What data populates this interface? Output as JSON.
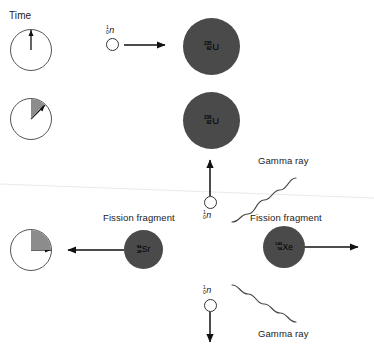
{
  "figure": {
    "background_color": "#ffffff",
    "nucleus_color": "#4a4a4a",
    "line_color": "#333333"
  },
  "time_axis": {
    "label": "Time",
    "clocks": [
      {
        "name": "clock-stage-1",
        "hand_angle_deg": 0,
        "wedge_end_deg": 0,
        "wedge_filled": false
      },
      {
        "name": "clock-stage-2",
        "hand_angle_deg": 42,
        "wedge_end_deg": 42,
        "wedge_filled": true
      },
      {
        "name": "clock-stage-3",
        "hand_angle_deg": 90,
        "wedge_end_deg": 90,
        "wedge_filled": true
      }
    ]
  },
  "particles": {
    "incident_neutron": {
      "symbol": "n",
      "mass_number": "1",
      "atomic_number": "0",
      "direction": "right"
    },
    "emitted_neutron_up": {
      "symbol": "n",
      "mass_number": "1",
      "atomic_number": "0",
      "direction": "up"
    },
    "emitted_neutron_down": {
      "symbol": "n",
      "mass_number": "1",
      "atomic_number": "0",
      "direction": "down"
    }
  },
  "nuclei": {
    "uranium_235": {
      "symbol": "U",
      "mass_number": "235",
      "atomic_number": "92"
    },
    "uranium_236": {
      "symbol": "U",
      "mass_number": "236",
      "atomic_number": "92"
    },
    "strontium_94": {
      "symbol": "Sr",
      "mass_number": "94",
      "atomic_number": "38"
    },
    "xenon_140": {
      "symbol": "Xe",
      "mass_number": "140",
      "atomic_number": "54"
    }
  },
  "annotations": {
    "gamma_ray_top": "Gamma ray",
    "gamma_ray_bottom": "Gamma ray",
    "fission_fragment_left": "Fission fragment",
    "fission_fragment_right": "Fission fragment"
  }
}
